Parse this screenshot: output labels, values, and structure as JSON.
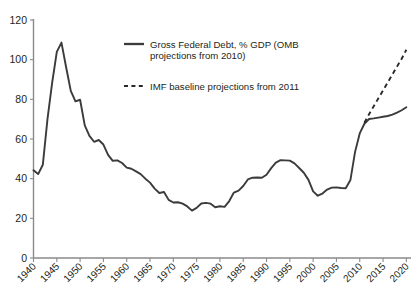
{
  "chart_data": {
    "type": "line",
    "title": "",
    "subtitle": "",
    "xlabel": "",
    "ylabel": "",
    "xlim": [
      1940,
      2021
    ],
    "ylim": [
      0,
      120
    ],
    "grid": false,
    "legend_position": "upper-center",
    "y_ticks": [
      0,
      20,
      40,
      60,
      80,
      100,
      120
    ],
    "x_ticks": [
      1940,
      1945,
      1950,
      1955,
      1960,
      1965,
      1970,
      1975,
      1980,
      1985,
      1990,
      1995,
      2000,
      2005,
      2010,
      2015,
      2020
    ],
    "x_tick_labels": [
      "1940",
      "1945",
      "1950",
      "1955",
      "1960",
      "1965",
      "1970",
      "1975",
      "1980",
      "1985",
      "1990",
      "1995",
      "2000",
      "2005",
      "2010",
      "2015",
      "2020"
    ],
    "y_tick_labels": [
      "0",
      "20",
      "40",
      "60",
      "80",
      "100",
      "120"
    ],
    "series": [
      {
        "name": "Gross Federal Debt, % GDP (OMB projections from 2010)",
        "style": "solid",
        "color": "#3b3b3b",
        "x": [
          1940,
          1941,
          1942,
          1943,
          1944,
          1945,
          1946,
          1947,
          1948,
          1949,
          1950,
          1951,
          1952,
          1953,
          1954,
          1955,
          1956,
          1957,
          1958,
          1959,
          1960,
          1961,
          1962,
          1963,
          1964,
          1965,
          1966,
          1967,
          1968,
          1969,
          1970,
          1971,
          1972,
          1973,
          1974,
          1975,
          1976,
          1977,
          1978,
          1979,
          1980,
          1981,
          1982,
          1983,
          1984,
          1985,
          1986,
          1987,
          1988,
          1989,
          1990,
          1991,
          1992,
          1993,
          1994,
          1995,
          1996,
          1997,
          1998,
          1999,
          2000,
          2001,
          2002,
          2003,
          2004,
          2005,
          2006,
          2007,
          2008,
          2009,
          2010,
          2011,
          2012,
          2013,
          2014,
          2015,
          2016,
          2017,
          2018,
          2019,
          2020
        ],
        "y": [
          44.2,
          42.3,
          47.0,
          70.0,
          88.3,
          103.9,
          108.6,
          96.2,
          84.3,
          79.0,
          79.8,
          66.9,
          61.6,
          58.6,
          59.5,
          57.2,
          52.0,
          49.0,
          49.2,
          47.9,
          45.6,
          45.0,
          43.7,
          42.3,
          40.0,
          38.0,
          35.0,
          32.8,
          33.3,
          29.3,
          28.0,
          28.1,
          27.4,
          26.0,
          23.9,
          25.3,
          27.5,
          27.8,
          27.4,
          25.6,
          26.1,
          25.8,
          28.7,
          33.0,
          34.0,
          36.3,
          39.6,
          40.5,
          40.6,
          40.5,
          42.0,
          45.3,
          48.1,
          49.3,
          49.2,
          49.1,
          47.7,
          45.4,
          43.0,
          39.4,
          33.6,
          31.4,
          32.5,
          34.5,
          35.5,
          35.6,
          35.3,
          35.2,
          39.3,
          53.5,
          62.8,
          67.7,
          70.1,
          70.4,
          70.8,
          71.2,
          71.6,
          72.3,
          73.3,
          74.5,
          76.0
        ]
      },
      {
        "name": "IMF baseline projections from 2011",
        "style": "dashed",
        "color": "#2a2a2a",
        "x": [
          2011,
          2012,
          2013,
          2014,
          2015,
          2016,
          2017,
          2018,
          2019,
          2020
        ],
        "y": [
          68.2,
          72.5,
          76.5,
          80.5,
          84.5,
          88.5,
          92.5,
          96.5,
          100.5,
          105.0
        ]
      }
    ],
    "legend": [
      {
        "label_line1": "Gross Federal Debt, % GDP (OMB",
        "label_line2": "projections from 2010)",
        "style": "solid"
      },
      {
        "label_line1": "IMF baseline projections from 2011",
        "label_line2": "",
        "style": "dashed"
      }
    ]
  },
  "legend": {
    "entry_solid_line1": "Gross Federal Debt, % GDP (OMB",
    "entry_solid_line2": "projections from 2010)",
    "entry_dashed_line1": "IMF baseline projections from 2011"
  }
}
